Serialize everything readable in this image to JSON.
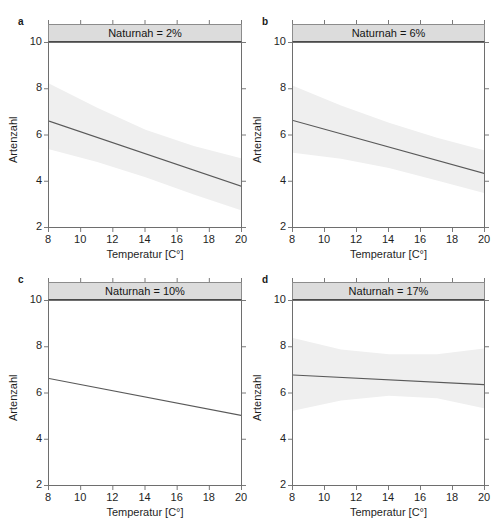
{
  "figure": {
    "width": 495,
    "height": 520,
    "background": "#ffffff",
    "line_color": "#595959",
    "band_color": "#efefef",
    "strip_fill": "#dcdcdc",
    "axis_color": "#6e6e6e"
  },
  "axes": {
    "xlabel": "Temperatur [C°]",
    "ylabel": "Artenzahl",
    "xlim": [
      8,
      20
    ],
    "ylim": [
      2,
      10
    ],
    "xticks": [
      8,
      10,
      12,
      14,
      16,
      18,
      20
    ],
    "xtick_labels": [
      "8",
      "10",
      "12",
      "14",
      "16",
      "18",
      "20"
    ],
    "yticks": [
      2,
      4,
      6,
      8,
      10
    ],
    "ytick_labels": [
      "2",
      "4",
      "6",
      "8",
      "10"
    ],
    "grid": false
  },
  "panels": [
    {
      "letter": "a",
      "strip_title": "Naturnah = 2%",
      "naturnah_percent": 2,
      "line": {
        "x": [
          8,
          20
        ],
        "y": [
          6.62,
          3.8
        ]
      },
      "band_upper": {
        "x": [
          8,
          11,
          14,
          17,
          20
        ],
        "y": [
          8.25,
          7.2,
          6.25,
          5.55,
          5.0
        ]
      },
      "band_lower": {
        "x": [
          8,
          11,
          14,
          17,
          20
        ],
        "y": [
          5.4,
          4.85,
          4.2,
          3.45,
          2.75
        ]
      },
      "band_visible": true
    },
    {
      "letter": "b",
      "strip_title": "Naturnah = 6%",
      "naturnah_percent": 6,
      "line": {
        "x": [
          8,
          20
        ],
        "y": [
          6.65,
          4.35
        ]
      },
      "band_upper": {
        "x": [
          8,
          11,
          14,
          17,
          20
        ],
        "y": [
          8.15,
          7.3,
          6.55,
          5.9,
          5.35
        ]
      },
      "band_lower": {
        "x": [
          8,
          11,
          14,
          17,
          20
        ],
        "y": [
          5.25,
          5.0,
          4.6,
          4.05,
          3.5
        ]
      },
      "band_visible": true
    },
    {
      "letter": "c",
      "strip_title": "Naturnah = 10%",
      "naturnah_percent": 10,
      "line": {
        "x": [
          8,
          20
        ],
        "y": [
          6.65,
          5.05
        ]
      },
      "band_upper": {
        "x": [
          8,
          11,
          14,
          17,
          20
        ],
        "y": [
          6.95,
          6.55,
          6.1,
          5.6,
          5.3
        ]
      },
      "band_lower": {
        "x": [
          8,
          11,
          14,
          17,
          20
        ],
        "y": [
          6.35,
          6.05,
          5.65,
          5.2,
          4.8
        ]
      },
      "band_visible": false
    },
    {
      "letter": "d",
      "strip_title": "Naturnah = 17%",
      "naturnah_percent": 17,
      "line": {
        "x": [
          8,
          20
        ],
        "y": [
          6.8,
          6.38
        ]
      },
      "band_upper": {
        "x": [
          8,
          11,
          14,
          17,
          20
        ],
        "y": [
          8.4,
          7.9,
          7.7,
          7.7,
          7.95
        ]
      },
      "band_lower": {
        "x": [
          8,
          11,
          14,
          17,
          20
        ],
        "y": [
          5.25,
          5.7,
          5.9,
          5.8,
          5.35
        ]
      },
      "band_visible": true
    }
  ],
  "chart_data": {
    "type": "line",
    "title": "",
    "subtitle": "",
    "xlabel": "Temperatur [C°]",
    "ylabel": "Artenzahl",
    "xlim": [
      8,
      20
    ],
    "ylim": [
      2,
      10
    ],
    "xticks": [
      8,
      10,
      12,
      14,
      16,
      18,
      20
    ],
    "yticks": [
      2,
      4,
      6,
      8,
      10
    ],
    "grid": false,
    "legend": "none",
    "panel_layout": "2x2 lattice, conditioned on Naturnah (%)",
    "panels": [
      {
        "panel": "a",
        "condition": "Naturnah = 2%",
        "series": [
          {
            "name": "Regressionsgerade",
            "x": [
              8,
              20
            ],
            "values": [
              6.62,
              3.8
            ],
            "slope_per_degC": -0.235,
            "intercept_at_x8": 6.62
          },
          {
            "name": "Konfidenzband oben",
            "x": [
              8,
              11,
              14,
              17,
              20
            ],
            "values": [
              8.25,
              7.2,
              6.25,
              5.55,
              5.0
            ]
          },
          {
            "name": "Konfidenzband unten",
            "x": [
              8,
              11,
              14,
              17,
              20
            ],
            "values": [
              5.4,
              4.85,
              4.2,
              3.45,
              2.75
            ]
          }
        ]
      },
      {
        "panel": "b",
        "condition": "Naturnah = 6%",
        "series": [
          {
            "name": "Regressionsgerade",
            "x": [
              8,
              20
            ],
            "values": [
              6.65,
              4.35
            ],
            "slope_per_degC": -0.192,
            "intercept_at_x8": 6.65
          },
          {
            "name": "Konfidenzband oben",
            "x": [
              8,
              11,
              14,
              17,
              20
            ],
            "values": [
              8.15,
              7.3,
              6.55,
              5.9,
              5.35
            ]
          },
          {
            "name": "Konfidenzband unten",
            "x": [
              8,
              11,
              14,
              17,
              20
            ],
            "values": [
              5.25,
              5.0,
              4.6,
              4.05,
              3.5
            ]
          }
        ]
      },
      {
        "panel": "c",
        "condition": "Naturnah = 10%",
        "series": [
          {
            "name": "Regressionsgerade",
            "x": [
              8,
              20
            ],
            "values": [
              6.65,
              5.05
            ],
            "slope_per_degC": -0.133,
            "intercept_at_x8": 6.65
          }
        ]
      },
      {
        "panel": "d",
        "condition": "Naturnah = 17%",
        "series": [
          {
            "name": "Regressionsgerade",
            "x": [
              8,
              20
            ],
            "values": [
              6.8,
              6.38
            ],
            "slope_per_degC": -0.035,
            "intercept_at_x8": 6.8
          },
          {
            "name": "Konfidenzband oben",
            "x": [
              8,
              11,
              14,
              17,
              20
            ],
            "values": [
              8.4,
              7.9,
              7.7,
              7.7,
              7.95
            ]
          },
          {
            "name": "Konfidenzband unten",
            "x": [
              8,
              11,
              14,
              17,
              20
            ],
            "values": [
              5.25,
              5.7,
              5.9,
              5.8,
              5.35
            ]
          }
        ]
      }
    ]
  }
}
